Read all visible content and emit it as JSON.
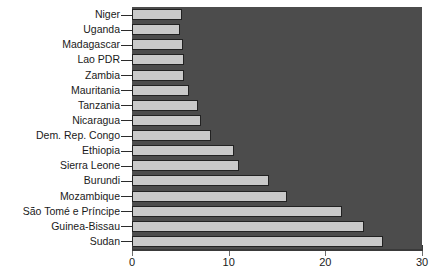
{
  "chart_data": {
    "type": "bar",
    "orientation": "horizontal",
    "title": "",
    "subtitle": "",
    "xlabel": "",
    "ylabel": "",
    "xlim": [
      0,
      30
    ],
    "grid": false,
    "legend": false,
    "legend_position": "none",
    "categories": [
      "Niger",
      "Uganda",
      "Madagascar",
      "Lao PDR",
      "Zambia",
      "Mauritania",
      "Tanzania",
      "Nicaragua",
      "Dem. Rep. Congo",
      "Ethiopia",
      "Sierra Leone",
      "Burundi",
      "Mozambique",
      "São Tomé e Príncipe",
      "Guinea-Bissau",
      "Sudan"
    ],
    "values": [
      5.2,
      5.0,
      5.3,
      5.4,
      5.4,
      5.9,
      6.8,
      7.1,
      8.2,
      10.6,
      11.1,
      14.2,
      16.0,
      21.7,
      24.0,
      26.0
    ],
    "xticks": [
      0,
      10,
      20,
      30
    ],
    "xticklabels": [
      "0",
      "10",
      "20",
      "30"
    ]
  },
  "colors": {
    "plot_background": "#4c4c4c",
    "bar_fill": "#c9c9c9",
    "bar_border": "#222222",
    "axis": "#3a3a3a",
    "text": "#1a1a1a",
    "page_background": "#ffffff"
  }
}
